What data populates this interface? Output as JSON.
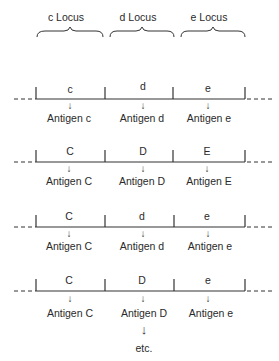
{
  "loci": [
    {
      "label": "c Locus",
      "x": 66
    },
    {
      "label": "d Locus",
      "x": 138
    },
    {
      "label": "e Locus",
      "x": 209
    }
  ],
  "rows": [
    {
      "alleles": [
        "c",
        "d",
        "e"
      ],
      "antigens": [
        "Antigen c",
        "Antigen d",
        "Antigen e"
      ]
    },
    {
      "alleles": [
        "C",
        "D",
        "E"
      ],
      "antigens": [
        "Antigen C",
        "Antigen D",
        "Antigen E"
      ]
    },
    {
      "alleles": [
        "C",
        "d",
        "e"
      ],
      "antigens": [
        "Antigen C",
        "Antigen d",
        "Antigen e"
      ]
    },
    {
      "alleles": [
        "C",
        "D",
        "e"
      ],
      "antigens": [
        "Antigen C",
        "Antigen D",
        "Antigen e"
      ]
    }
  ],
  "arrow_glyph": "↓",
  "footer": {
    "arrow": "↓",
    "text": "etc."
  }
}
